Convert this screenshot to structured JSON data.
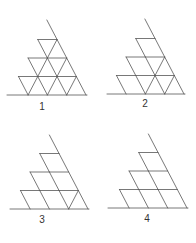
{
  "diagram": {
    "line_color": "#555555",
    "label_color": "#333333",
    "row_height": 18.5,
    "cell_width": 19.3,
    "rows": 3,
    "figures": [
      {
        "label": "1",
        "base_y": 95,
        "right_x": 86,
        "base_left_x": 7,
        "apex_y": 20,
        "label_pos": [
          42,
          107
        ],
        "slash_diagonals": [
          [
            1
          ],
          [
            1,
            2
          ],
          [
            1,
            2,
            3
          ]
        ]
      },
      {
        "label": "2",
        "base_y": 94,
        "right_x": 184,
        "base_left_x": 107,
        "apex_y": 19,
        "label_pos": [
          145,
          104
        ],
        "slash_diagonals": [
          [],
          [
            2
          ],
          [
            2,
            3
          ]
        ]
      },
      {
        "label": "3",
        "base_y": 209,
        "right_x": 88,
        "base_left_x": 10,
        "apex_y": 135,
        "label_pos": [
          42,
          220
        ],
        "slash_diagonals": [
          [],
          [],
          [
            3
          ]
        ]
      },
      {
        "label": "4",
        "base_y": 208,
        "right_x": 187,
        "base_left_x": 108,
        "apex_y": 134,
        "label_pos": [
          147,
          219
        ],
        "slash_diagonals": [
          [],
          [],
          []
        ]
      }
    ]
  }
}
